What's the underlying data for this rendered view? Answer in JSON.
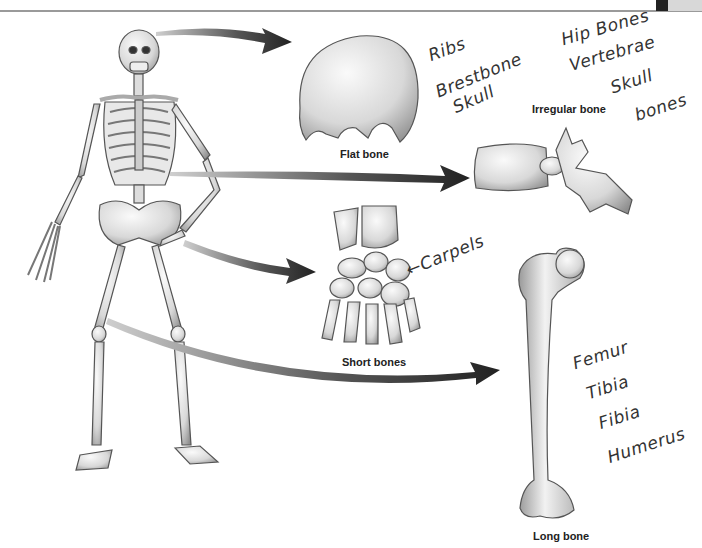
{
  "labels": {
    "flat": "Flat bone",
    "irregular": "Irregular bone",
    "short": "Short bones",
    "long": "Long bone"
  },
  "annotations": {
    "flat": [
      "Ribs",
      "Brestbone",
      "Skull"
    ],
    "irregular": [
      "Hip Bones",
      "Vertebrae",
      "Skull",
      "bones"
    ],
    "short": "←Carpels",
    "long": [
      "Femur",
      "Tibia",
      "Fibia",
      "Humerus"
    ]
  },
  "colors": {
    "arrow": "#2e2e2e",
    "bone": "#e6e6e6",
    "bone_shadow": "#9c9c9c",
    "outline": "#555555"
  }
}
